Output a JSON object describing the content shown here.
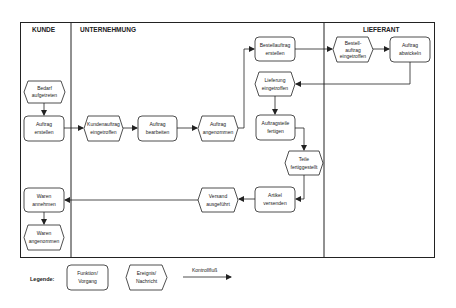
{
  "lanes": [
    {
      "id": "kunde",
      "title": "KUNDE"
    },
    {
      "id": "unternehmung",
      "title": "UNTERNEHMUNG"
    },
    {
      "id": "lieferant",
      "title": "LIEFERANT"
    }
  ],
  "nodes": {
    "bedarf_aufgetreten": {
      "type": "event",
      "lines": [
        "Bedarf",
        "aufgetreten"
      ]
    },
    "auftrag_erstellen": {
      "type": "function",
      "lines": [
        "Auftrag",
        "erstellen"
      ]
    },
    "kundenauftrag_eingetroffen": {
      "type": "event",
      "lines": [
        "Kundenauftrag",
        "eingetroffen"
      ]
    },
    "auftrag_bearbeiten": {
      "type": "function",
      "lines": [
        "Auftrag",
        "bearbeiten"
      ]
    },
    "auftrag_angenommen": {
      "type": "event",
      "lines": [
        "Auftrag",
        "angenommen"
      ]
    },
    "bestellauftrag_erstellen": {
      "type": "function",
      "lines": [
        "Bestellauftrag",
        "erstellen"
      ]
    },
    "lieferung_eingetroffen": {
      "type": "event",
      "lines": [
        "Lieferung",
        "eingetroffen"
      ]
    },
    "auftragsteile_fertigen": {
      "type": "function",
      "lines": [
        "Auftragsteile",
        "fertigen"
      ]
    },
    "teile_fertiggestellt": {
      "type": "event",
      "lines": [
        "Teile",
        "fertiggestellt"
      ]
    },
    "artikel_versenden": {
      "type": "function",
      "lines": [
        "Artikel",
        "versenden"
      ]
    },
    "versand_ausgefuehrt": {
      "type": "event",
      "lines": [
        "Versand",
        "ausgeführt"
      ]
    },
    "waren_annehmen": {
      "type": "function",
      "lines": [
        "Waren",
        "annehmen"
      ]
    },
    "waren_angenommen": {
      "type": "event",
      "lines": [
        "Waren",
        "angenommen"
      ]
    },
    "bestellauftrag_eingetroffen": {
      "type": "event",
      "lines": [
        "Bestell-",
        "auftrag",
        "eingetroffen"
      ]
    },
    "auftrag_abwickeln": {
      "type": "function",
      "lines": [
        "Auftrag",
        "abwickeln"
      ]
    }
  },
  "legend": {
    "label": "Legende:",
    "function": [
      "Funktion/",
      "Vorgang"
    ],
    "event": [
      "Ereignis/",
      "Nachricht"
    ],
    "flow": "Kontrollfluß"
  },
  "colors": {
    "stroke": "#222222",
    "background": "#ffffff",
    "text": "#222222"
  }
}
